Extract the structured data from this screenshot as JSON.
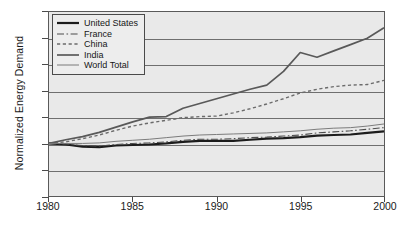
{
  "chart_data": {
    "type": "line",
    "title": "",
    "xlabel": "",
    "ylabel": "Normalized  Energy Demand",
    "xlim": [
      1980,
      2000
    ],
    "ylim": [
      0.0,
      3.5
    ],
    "grid": true,
    "legend_position": "top-left",
    "x": [
      1980,
      1981,
      1982,
      1983,
      1984,
      1985,
      1986,
      1987,
      1988,
      1989,
      1990,
      1991,
      1992,
      1993,
      1994,
      1995,
      1996,
      1997,
      1998,
      1999,
      2000
    ],
    "xticks": [
      "1980",
      "1985",
      "1990",
      "1995",
      "2000"
    ],
    "xtick_values": [
      1980,
      1985,
      1990,
      1995,
      2000
    ],
    "yticks": [
      "0.0",
      "0.5",
      "1.0",
      "1.5",
      "2.0",
      "2.5",
      "3.0",
      "3.5"
    ],
    "ytick_values": [
      0.0,
      0.5,
      1.0,
      1.5,
      2.0,
      2.5,
      3.0,
      3.5
    ],
    "series": [
      {
        "name": "United States",
        "style": "solid-thick",
        "color": "#1c1c1c",
        "width": 2.2,
        "dash": "",
        "values": [
          1.0,
          0.98,
          0.94,
          0.93,
          0.96,
          0.97,
          0.98,
          1.0,
          1.03,
          1.05,
          1.05,
          1.05,
          1.07,
          1.09,
          1.1,
          1.12,
          1.15,
          1.16,
          1.17,
          1.2,
          1.23
        ]
      },
      {
        "name": "France",
        "style": "dash-dot",
        "color": "#4d4d4d",
        "width": 1.1,
        "dash": "7,2.5,1.6,2.5",
        "values": [
          1.0,
          0.99,
          0.96,
          0.95,
          0.98,
          1.0,
          1.01,
          1.03,
          1.06,
          1.08,
          1.08,
          1.09,
          1.11,
          1.12,
          1.14,
          1.16,
          1.2,
          1.22,
          1.24,
          1.27,
          1.3
        ]
      },
      {
        "name": "China",
        "style": "dotted",
        "color": "#6b6b6b",
        "width": 1.4,
        "dash": "3.2,2.6",
        "values": [
          1.0,
          1.03,
          1.09,
          1.16,
          1.25,
          1.33,
          1.39,
          1.44,
          1.49,
          1.51,
          1.52,
          1.58,
          1.66,
          1.75,
          1.85,
          1.96,
          2.03,
          2.08,
          2.11,
          2.12,
          2.2
        ]
      },
      {
        "name": "India",
        "style": "solid",
        "color": "#595959",
        "width": 1.7,
        "dash": "",
        "values": [
          1.0,
          1.07,
          1.13,
          1.21,
          1.31,
          1.41,
          1.5,
          1.51,
          1.67,
          1.76,
          1.85,
          1.94,
          2.03,
          2.11,
          2.37,
          2.73,
          2.64,
          2.76,
          2.88,
          3.0,
          3.2
        ]
      },
      {
        "name": "World Total",
        "style": "solid-thin",
        "color": "#7a7a7a",
        "width": 1.0,
        "dash": "",
        "values": [
          1.0,
          1.0,
          1.0,
          1.01,
          1.04,
          1.06,
          1.08,
          1.11,
          1.14,
          1.16,
          1.17,
          1.18,
          1.19,
          1.2,
          1.22,
          1.24,
          1.27,
          1.29,
          1.3,
          1.33,
          1.37
        ]
      }
    ]
  },
  "legend": {
    "items": [
      {
        "label": "United States"
      },
      {
        "label": "France"
      },
      {
        "label": "China"
      },
      {
        "label": "India"
      },
      {
        "label": "World Total"
      }
    ]
  }
}
